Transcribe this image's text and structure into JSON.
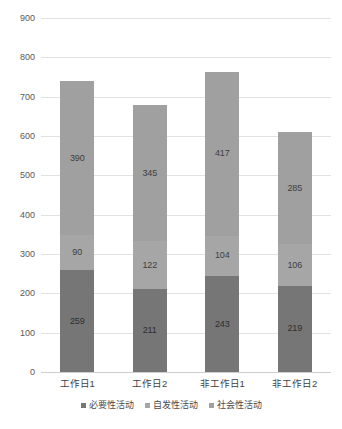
{
  "chart_data": {
    "type": "bar",
    "subtype": "stacked-column",
    "title": "",
    "xlabel": "",
    "ylabel": "",
    "ylim": [
      0,
      900
    ],
    "ytick_step": 100,
    "yticks": [
      "900",
      "800",
      "700",
      "600",
      "500",
      "400",
      "300",
      "200",
      "100",
      "0"
    ],
    "grid": true,
    "legend_position": "bottom",
    "categories": [
      "工作日1",
      "工作日2",
      "非工作日1",
      "非工作日2"
    ],
    "series": [
      {
        "name": "必要性活动",
        "color": "#767676",
        "values": [
          259,
          211,
          243,
          219
        ],
        "labels": [
          "259",
          "211",
          "243",
          "219"
        ]
      },
      {
        "name": "自发性活动",
        "color": "#a6a6a6",
        "values": [
          90,
          122,
          104,
          106
        ],
        "labels": [
          "90",
          "122",
          "104",
          "106"
        ]
      },
      {
        "name": "社会性活动",
        "color": "#a0a0a0",
        "values": [
          390,
          345,
          417,
          285
        ],
        "labels": [
          "390",
          "345",
          "417",
          "285"
        ]
      }
    ],
    "totals": [
      739,
      678,
      764,
      610
    ]
  },
  "legend": {
    "items": [
      {
        "label": "必要性活动",
        "color": "#767676"
      },
      {
        "label": "自发性活动",
        "color": "#a6a6a6"
      },
      {
        "label": "社会性活动",
        "color": "#a0a0a0"
      }
    ]
  },
  "axis": {
    "y_ticks": [
      "900",
      "800",
      "700",
      "600",
      "500",
      "400",
      "300",
      "200",
      "100",
      "0"
    ],
    "x_ticks": [
      "工作日1",
      "工作日2",
      "非工作日1",
      "非工作日2"
    ]
  }
}
